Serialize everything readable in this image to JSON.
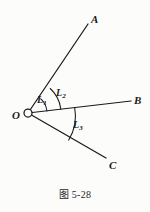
{
  "figure": {
    "caption": "图 5-28",
    "vertex": {
      "name": "O",
      "label": "O",
      "x": 28,
      "y": 113,
      "marker": "open-circle",
      "marker_radius": 4
    },
    "rays": [
      {
        "name": "ray-OA",
        "label": "A",
        "from": [
          28,
          113
        ],
        "to": [
          88,
          24
        ]
      },
      {
        "name": "ray-OB",
        "label": "B",
        "from": [
          28,
          113
        ],
        "to": [
          131,
          101
        ]
      },
      {
        "name": "ray-OC",
        "label": "C",
        "from": [
          28,
          113
        ],
        "to": [
          106,
          158
        ]
      }
    ],
    "arcs": [
      {
        "name": "arc-L1",
        "label": "L",
        "subscript": "1",
        "radius": 19,
        "between": [
          "ray-OA",
          "ray-OB"
        ],
        "path": "M 40.8 98.9 A 19 19 0 0 1 46.9 111.0"
      },
      {
        "name": "arc-L2",
        "label": "L",
        "subscript": "2",
        "radius": 33,
        "between": [
          "ray-OA",
          "ray-OB"
        ],
        "path": "M 50.2 88.5 A 33 33 0 0 1 60.8 109.1"
      },
      {
        "name": "arc-L3",
        "label": "L",
        "subscript": "3",
        "radius": 47,
        "between": [
          "ray-OB",
          "ray-OC"
        ],
        "path": "M 74.7 107.6 A 47 47 0 0 1 68.7 140.1"
      }
    ],
    "colors": {
      "background": "#fcfcfb",
      "stroke": "#1a1a1a",
      "label": "#1a1a1a"
    }
  }
}
